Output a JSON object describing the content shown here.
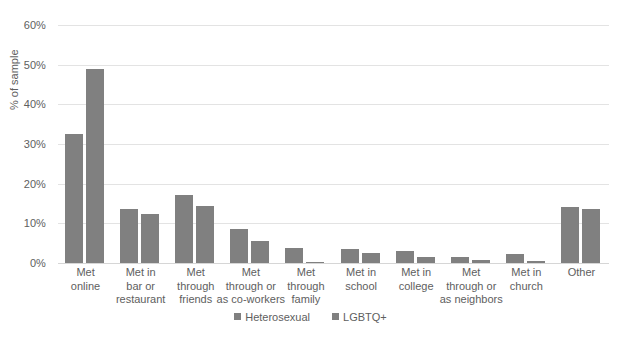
{
  "chart_data": {
    "type": "bar",
    "title": "",
    "xlabel": "",
    "ylabel": "% of sample",
    "ylim": [
      0,
      60
    ],
    "ytick_labels": [
      "60%",
      "50%",
      "40%",
      "30%",
      "20%",
      "10%",
      "0%"
    ],
    "ytick_values": [
      60,
      50,
      40,
      30,
      20,
      10,
      0
    ],
    "grid": true,
    "legend_position": "bottom",
    "bar_color": "#808080",
    "categories": [
      "Met online",
      "Met in bar or restaurant",
      "Met through friends",
      "Met through or as co-workers",
      "Met through family",
      "Met in school",
      "Met in college",
      "Met through or as neighbors",
      "Met in church",
      "Other"
    ],
    "category_label_lines": [
      [
        "Met",
        "online"
      ],
      [
        "Met in",
        "bar or",
        "restaurant"
      ],
      [
        "Met",
        "through",
        "friends"
      ],
      [
        "Met",
        "through or",
        "as co-workers"
      ],
      [
        "Met",
        "through",
        "family"
      ],
      [
        "Met in",
        "school"
      ],
      [
        "Met in",
        "college"
      ],
      [
        "Met",
        "through or",
        "as neighbors"
      ],
      [
        "Met in",
        "church"
      ],
      [
        "Other"
      ]
    ],
    "series": [
      {
        "name": "Heterosexual",
        "color": "#808080",
        "values": [
          32.5,
          13.5,
          17.2,
          8.5,
          3.7,
          3.6,
          3.1,
          1.4,
          2.2,
          14.1
        ]
      },
      {
        "name": "LGBTQ+",
        "color": "#808080",
        "values": [
          49.0,
          12.3,
          14.4,
          5.5,
          0.2,
          2.5,
          1.5,
          0.8,
          0.6,
          13.6
        ]
      }
    ]
  }
}
